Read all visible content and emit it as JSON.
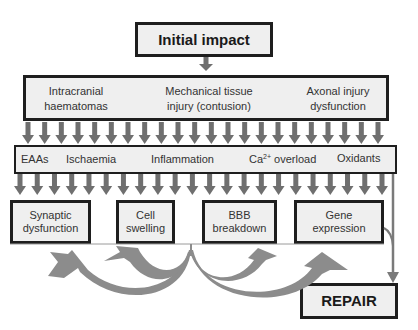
{
  "diagram": {
    "initial": {
      "label": "Initial impact"
    },
    "primary_injuries": [
      {
        "line1": "Intracranial",
        "line2": "haematomas"
      },
      {
        "line1": "Mechanical tissue",
        "line2": "injury (contusion)"
      },
      {
        "line1": "Axonal injury",
        "line2": "dysfunction"
      }
    ],
    "mediators": {
      "eaas": "EAAs",
      "ischaemia": "Ischaemia",
      "inflammation": "Inflammation",
      "calcium_prefix": "Ca",
      "calcium_sup": "2+",
      "calcium_suffix": " overload",
      "oxidants": "Oxidants"
    },
    "outcomes": [
      {
        "line1": "Synaptic",
        "line2": "dysfunction"
      },
      {
        "line1": "Cell",
        "line2": "swelling"
      },
      {
        "line1": "BBB",
        "line2": "breakdown"
      },
      {
        "line1": "Gene",
        "line2": "expression"
      }
    ],
    "repair": {
      "label": "REPAIR"
    },
    "colors": {
      "box_fill": "#efefef",
      "box_border": "#1e1e1e",
      "arrow": "#6f6f6f",
      "curve_arrow": "#8c8c8c"
    },
    "arrow_rows": {
      "row1_count": 22,
      "row2_count": 22
    }
  }
}
